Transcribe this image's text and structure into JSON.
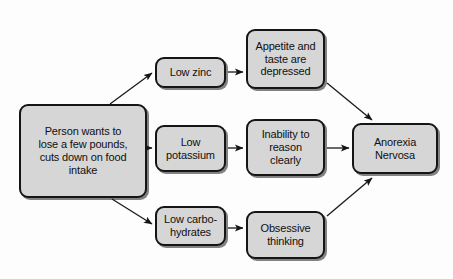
{
  "diagram": {
    "background_color": "#fdfdfd",
    "node_fill_color": "#d6d6d6",
    "node_border_color": "#151515",
    "edge_color": "#1a1a1a",
    "nodes": [
      {
        "id": "source",
        "name": "person-wants-to-lose-weight",
        "label": "Person wants to\nlose a few pounds,\ncuts down on food\nintake",
        "x": 19,
        "y": 104,
        "w": 128,
        "h": 94
      },
      {
        "id": "zinc",
        "name": "low-zinc",
        "label": "Low zinc",
        "x": 155,
        "y": 57,
        "w": 71,
        "h": 31
      },
      {
        "id": "potassium",
        "name": "low-potassium",
        "label": "Low\npotassium",
        "x": 155,
        "y": 125,
        "w": 71,
        "h": 47
      },
      {
        "id": "carbs",
        "name": "low-carbohydrates",
        "label": "Low carbo-\nhydrates",
        "x": 155,
        "y": 206,
        "w": 71,
        "h": 40
      },
      {
        "id": "appetite",
        "name": "appetite-and-taste-depressed",
        "label": "Appetite and\ntaste are\ndepressed",
        "x": 246,
        "y": 29,
        "w": 79,
        "h": 60
      },
      {
        "id": "reason",
        "name": "inability-to-reason-clearly",
        "label": "Inability to\nreason\nclearly",
        "x": 246,
        "y": 119,
        "w": 79,
        "h": 57
      },
      {
        "id": "obsessive",
        "name": "obsessive-thinking",
        "label": "Obsessive\nthinking",
        "x": 246,
        "y": 211,
        "w": 79,
        "h": 48
      },
      {
        "id": "anorexia",
        "name": "anorexia-nervosa",
        "label": "Anorexia\nNervosa",
        "x": 352,
        "y": 123,
        "w": 86,
        "h": 51
      }
    ],
    "edges": [
      {
        "id": "e1",
        "name": "edge-source-to-low-zinc",
        "from": "source",
        "to": "zinc",
        "x1": 110,
        "y1": 104,
        "x2": 152,
        "y2": 73
      },
      {
        "id": "e2",
        "name": "edge-source-to-low-potassium",
        "from": "source",
        "to": "potassium",
        "x1": 148,
        "y1": 148,
        "x2": 152,
        "y2": 148
      },
      {
        "id": "e3",
        "name": "edge-source-to-low-carbohydrates",
        "from": "source",
        "to": "carbs",
        "x1": 112,
        "y1": 199,
        "x2": 152,
        "y2": 224
      },
      {
        "id": "e4",
        "name": "edge-low-zinc-to-appetite",
        "from": "zinc",
        "to": "appetite",
        "x1": 228,
        "y1": 72,
        "x2": 243,
        "y2": 72
      },
      {
        "id": "e5",
        "name": "edge-low-potassium-to-reason",
        "from": "potassium",
        "to": "reason",
        "x1": 228,
        "y1": 148,
        "x2": 243,
        "y2": 148
      },
      {
        "id": "e6",
        "name": "edge-low-carbohydrates-to-obsessive",
        "from": "carbs",
        "to": "obsessive",
        "x1": 228,
        "y1": 228,
        "x2": 243,
        "y2": 228
      },
      {
        "id": "e7",
        "name": "edge-appetite-to-anorexia",
        "from": "appetite",
        "to": "anorexia",
        "x1": 327,
        "y1": 83,
        "x2": 372,
        "y2": 120
      },
      {
        "id": "e8",
        "name": "edge-reason-to-anorexia",
        "from": "reason",
        "to": "anorexia",
        "x1": 327,
        "y1": 148,
        "x2": 349,
        "y2": 148
      },
      {
        "id": "e9",
        "name": "edge-obsessive-to-anorexia",
        "from": "obsessive",
        "to": "anorexia",
        "x1": 327,
        "y1": 216,
        "x2": 372,
        "y2": 178
      }
    ]
  }
}
